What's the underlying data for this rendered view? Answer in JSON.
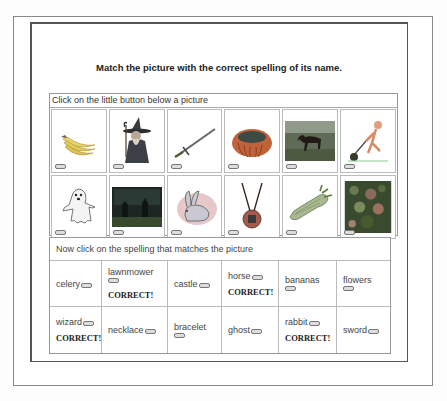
{
  "title": "Match the picture with the correct spelling of its name.",
  "pictures": {
    "instruction": "Click on the little button below a picture",
    "items": [
      {
        "name": "bananas",
        "icon": "bananas-image"
      },
      {
        "name": "wizard",
        "icon": "wizard-image"
      },
      {
        "name": "sword",
        "icon": "sword-image"
      },
      {
        "name": "bracelet",
        "icon": "bracelet-image"
      },
      {
        "name": "horse",
        "icon": "horse-image"
      },
      {
        "name": "lawnmower",
        "icon": "lawnmower-image"
      },
      {
        "name": "ghost",
        "icon": "ghost-image"
      },
      {
        "name": "castle",
        "icon": "castle-image"
      },
      {
        "name": "rabbit",
        "icon": "rabbit-image"
      },
      {
        "name": "necklace",
        "icon": "necklace-image"
      },
      {
        "name": "celery",
        "icon": "celery-image"
      },
      {
        "name": "flowers",
        "icon": "flowers-image"
      }
    ]
  },
  "words": {
    "instruction": "Now click on the spelling that matches the picture",
    "items": [
      {
        "word": "celery",
        "status": ""
      },
      {
        "word": "lawnmower",
        "status": "CORRECT!"
      },
      {
        "word": "castle",
        "status": ""
      },
      {
        "word": "horse",
        "status": "CORRECT!"
      },
      {
        "word": "bananas",
        "status": ""
      },
      {
        "word": "flowers",
        "status": ""
      },
      {
        "word": "wizard",
        "status": "CORRECT!"
      },
      {
        "word": "necklace",
        "status": ""
      },
      {
        "word": "bracelet",
        "status": ""
      },
      {
        "word": "ghost",
        "status": ""
      },
      {
        "word": "rabbit",
        "status": "CORRECT!"
      },
      {
        "word": "sword",
        "status": ""
      }
    ]
  }
}
